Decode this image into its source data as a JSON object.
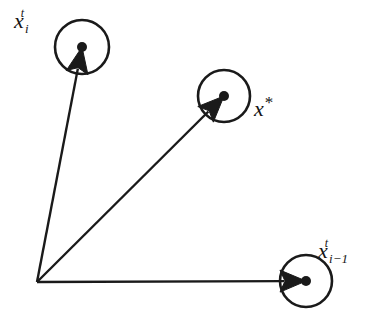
{
  "figure": {
    "name": "vector-update-diagram",
    "background_color": "#ffffff",
    "stroke_color": "#1a1a1a",
    "width": 382,
    "height": 326
  },
  "origin": {
    "name": "origin-vertex",
    "x": 37,
    "y": 282
  },
  "nodes": [
    {
      "id": "xit",
      "name": "node-xi-t",
      "label_base": "x",
      "label_sub": "i",
      "label_sup": "t",
      "label_plain": "x_i^t",
      "cx": 82,
      "cy": 47,
      "r": 27,
      "dot_r": 5,
      "label_x": 14,
      "label_y": 10
    },
    {
      "id": "xstar",
      "name": "node-x-star",
      "label_base": "x",
      "label_sub": "",
      "label_sup": "*",
      "label_plain": "x*",
      "cx": 224,
      "cy": 96,
      "r": 26,
      "dot_r": 5,
      "label_x": 254,
      "label_y": 98
    },
    {
      "id": "xim1",
      "name": "node-xi-minus-1-t",
      "label_base": "x",
      "label_sub": "i−1",
      "label_sup": "t",
      "label_plain": "x_{i-1}^t",
      "cx": 306,
      "cy": 281,
      "r": 26,
      "dot_r": 5,
      "label_x": 318,
      "label_y": 240
    }
  ],
  "arrows": [
    {
      "name": "arrow-to-xi-t",
      "from": "origin",
      "to": "xit",
      "tip_x": 82,
      "tip_y": 47
    },
    {
      "name": "arrow-to-x-star",
      "from": "origin",
      "to": "xstar",
      "tip_x": 224,
      "tip_y": 96
    },
    {
      "name": "arrow-to-xi-minus-1",
      "from": "origin",
      "to": "xim1",
      "tip_x": 306,
      "tip_y": 281
    }
  ]
}
